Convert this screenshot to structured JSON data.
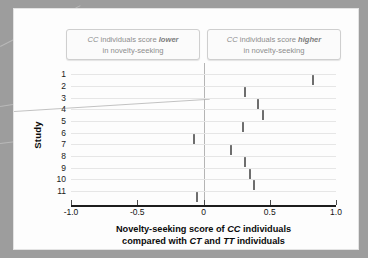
{
  "chart_data": {
    "type": "scatter",
    "title": "",
    "xlabel": "Novelty-seeking score of CC individuals compared with CT and TT individuals",
    "ylabel": "Study",
    "xlim": [
      -1.0,
      1.0
    ],
    "grid": true,
    "legend_position": "none",
    "xticks": [
      -1.0,
      -0.5,
      0,
      0.5,
      1.0
    ],
    "xticklabels": [
      "-1.0",
      "-0.5",
      "0",
      "0.5",
      "1.0"
    ],
    "categories": [
      "1",
      "2",
      "3",
      "4",
      "5",
      "6",
      "7",
      "8",
      "9",
      "10",
      "11"
    ],
    "values": [
      0.83,
      0.31,
      0.41,
      0.45,
      0.3,
      -0.07,
      0.21,
      0.31,
      0.35,
      0.38,
      -0.05
    ],
    "series": [
      {
        "name": "Novelty-seeking score",
        "points": [
          {
            "study": "1",
            "value": 0.83
          },
          {
            "study": "2",
            "value": 0.31
          },
          {
            "study": "3",
            "value": 0.41
          },
          {
            "study": "4",
            "value": 0.45
          },
          {
            "study": "5",
            "value": 0.3
          },
          {
            "study": "6",
            "value": -0.07
          },
          {
            "study": "7",
            "value": 0.21
          },
          {
            "study": "8",
            "value": 0.31
          },
          {
            "study": "9",
            "value": 0.35
          },
          {
            "study": "10",
            "value": 0.38
          },
          {
            "study": "11",
            "value": -0.05
          }
        ]
      }
    ],
    "reference_line": 0,
    "annotations": [
      {
        "position": "left",
        "line1": "CC individuals score lower",
        "line2": "in novelty-seeking"
      },
      {
        "position": "right",
        "line1": "CC individuals score higher",
        "line2": "in novelty-seeking"
      }
    ]
  },
  "axes": {
    "y_title": "Study",
    "y_labels": [
      "1",
      "2",
      "3",
      "4",
      "5",
      "6",
      "7",
      "8",
      "9",
      "10",
      "11"
    ],
    "x_tick_labels": [
      "-1.0",
      "-0.5",
      "0",
      "0.5",
      "1.0"
    ],
    "x_title_line1_a": "Novelty-seeking score of ",
    "x_title_line1_b": "CC",
    "x_title_line1_c": " individuals",
    "x_title_line2_a": "compared with ",
    "x_title_line2_b": "CT",
    "x_title_line2_c": " and ",
    "x_title_line2_d": "TT",
    "x_title_line2_e": " individuals"
  },
  "callouts": {
    "left": {
      "italic_gene": "CC",
      "text_mid": " individuals score ",
      "emphasis": "lower",
      "line2": "in novelty-seeking"
    },
    "right": {
      "italic_gene": "CC",
      "text_mid": " individuals score ",
      "emphasis": "higher",
      "line2": "in novelty-seeking"
    }
  },
  "colors": {
    "frame": "#9d9d9d",
    "panel": "#fdfdfd",
    "grid": "#e6e6e6",
    "marker": "#6e6e6e",
    "zero_line": "#b5b5b5",
    "callout_text": "#8d8d8d",
    "axis": "#1d1d1d"
  }
}
